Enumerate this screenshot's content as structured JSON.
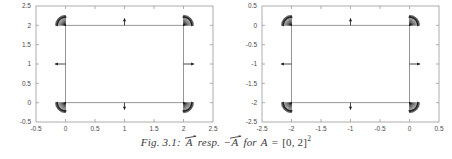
{
  "figure": {
    "caption_prefix": "Fig. 3.1:",
    "caption_vec1": "A",
    "caption_resp": "resp.",
    "caption_minus": "−",
    "caption_vec2": "A",
    "caption_for": "for",
    "caption_var": "A",
    "caption_eq": "=",
    "caption_set": "[0, 2]",
    "caption_exp": "2",
    "caption_full": "Fig. 3.1: ⃗A resp. −⃗A for A = [0, 2]²",
    "axis_color": "#9a9a9a",
    "tick_text_color": "#4a4a4a",
    "curve_color": "#8c8c8c",
    "arrow_color": "#1a1a1a",
    "background": "#ffffff"
  },
  "chart_data": [
    {
      "type": "scatter",
      "title": "",
      "subtitle": "",
      "xlabel": "",
      "ylabel": "",
      "xlim": [
        -0.5,
        2.5
      ],
      "ylim": [
        -0.5,
        2.5
      ],
      "xticks": [
        -0.5,
        0,
        0.5,
        1,
        1.5,
        2,
        2.5
      ],
      "xticklabels": [
        "-0.5",
        "0",
        "0.5",
        "1",
        "1.5",
        "2",
        "2.5"
      ],
      "yticks": [
        -0.5,
        0,
        0.5,
        1,
        1.5,
        2,
        2.5
      ],
      "yticklabels": [
        "-0.5",
        "0",
        "0.5",
        "1",
        "1.5",
        "2",
        "2.5"
      ],
      "grid": false,
      "legend": "none",
      "description": "Outward unit normal vector field on the boundary of the square A = [0,2]^2",
      "square": {
        "x0": 0,
        "y0": 0,
        "x1": 2,
        "y1": 2
      },
      "edge_arrows": [
        {
          "x": 1,
          "y": 2,
          "dx": 0,
          "dy": 0.18,
          "label": "up"
        },
        {
          "x": 1,
          "y": 0,
          "dx": 0,
          "dy": -0.18,
          "label": "down"
        },
        {
          "x": 0,
          "y": 1,
          "dx": -0.18,
          "dy": 0,
          "label": "left"
        },
        {
          "x": 2,
          "y": 1,
          "dx": 0.18,
          "dy": 0,
          "label": "right"
        }
      ],
      "corner_fans": [
        {
          "x": 0,
          "y": 2,
          "from_deg": 90,
          "to_deg": 180,
          "label": "top-left"
        },
        {
          "x": 2,
          "y": 2,
          "from_deg": 0,
          "to_deg": 90,
          "label": "top-right"
        },
        {
          "x": 0,
          "y": 0,
          "from_deg": 180,
          "to_deg": 270,
          "label": "bottom-left"
        },
        {
          "x": 2,
          "y": 0,
          "from_deg": 270,
          "to_deg": 360,
          "label": "bottom-right"
        }
      ]
    },
    {
      "type": "scatter",
      "title": "",
      "subtitle": "",
      "xlabel": "",
      "ylabel": "",
      "xlim": [
        -2.5,
        0.5
      ],
      "ylim": [
        -2.5,
        0.5
      ],
      "xticks": [
        -2.5,
        -2,
        -1.5,
        -1,
        -0.5,
        0,
        0.5
      ],
      "xticklabels": [
        "-2.5",
        "-2",
        "-1.5",
        "-1",
        "-0.5",
        "0",
        "0.5"
      ],
      "yticks": [
        -2.5,
        -2,
        -1.5,
        -1,
        -0.5,
        0,
        0.5
      ],
      "yticklabels": [
        "-2.5",
        "-2",
        "-1.5",
        "-1",
        "-0.5",
        "0",
        "0.5"
      ],
      "grid": false,
      "legend": "none",
      "description": "Reflected (negated) vector field on the boundary of -A = [-2,0]^2",
      "square": {
        "x0": -2,
        "y0": -2,
        "x1": 0,
        "y1": 0
      },
      "edge_arrows": [
        {
          "x": -1,
          "y": 0,
          "dx": 0,
          "dy": 0.18,
          "label": "up"
        },
        {
          "x": -1,
          "y": -2,
          "dx": 0,
          "dy": -0.18,
          "label": "down"
        },
        {
          "x": -2,
          "y": -1,
          "dx": -0.18,
          "dy": 0,
          "label": "left"
        },
        {
          "x": 0,
          "y": -1,
          "dx": 0.18,
          "dy": 0,
          "label": "right"
        }
      ],
      "corner_fans": [
        {
          "x": -2,
          "y": 0,
          "from_deg": 90,
          "to_deg": 180,
          "label": "top-left"
        },
        {
          "x": 0,
          "y": 0,
          "from_deg": 0,
          "to_deg": 90,
          "label": "top-right"
        },
        {
          "x": -2,
          "y": -2,
          "from_deg": 180,
          "to_deg": 270,
          "label": "bottom-left"
        },
        {
          "x": 0,
          "y": -2,
          "from_deg": 270,
          "to_deg": 360,
          "label": "bottom-right"
        }
      ]
    }
  ]
}
